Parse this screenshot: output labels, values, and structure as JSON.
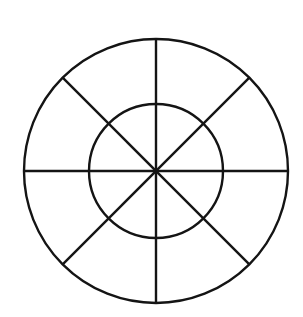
{
  "document": {
    "title": "Segmented Wheel Diagram",
    "background_color": "#ffffff",
    "width": 303,
    "height": 317
  },
  "chart_data": {
    "type": "pie",
    "title": "",
    "subtitle": "",
    "xlabel": "",
    "ylabel": "",
    "categories": [
      "S1",
      "S2",
      "S3",
      "S4",
      "S5",
      "S6",
      "S7",
      "S8"
    ],
    "values": [
      12.5,
      12.5,
      12.5,
      12.5,
      12.5,
      12.5,
      12.5,
      12.5
    ],
    "slice_angle_degrees": 45,
    "slice_count": 8,
    "legend": [],
    "labels_shown": false,
    "grid": false,
    "rings": [
      {
        "name": "outer-ring",
        "radius": 132
      },
      {
        "name": "inner-ring",
        "radius": 67
      }
    ]
  },
  "geometry": {
    "center": {
      "x": 156,
      "y": 171
    },
    "outer_circle": {
      "radius": 132,
      "left": 24,
      "right": 288,
      "top": 39,
      "bottom": 303
    },
    "inner_circle": {
      "radius": 67,
      "left": 89,
      "right": 223,
      "top": 104,
      "bottom": 238
    },
    "spokes": [
      {
        "name": "spoke-vertical",
        "angle_degrees": 90
      },
      {
        "name": "spoke-diagonal-ne-sw",
        "angle_degrees": 45
      },
      {
        "name": "spoke-horizontal",
        "angle_degrees": 0
      },
      {
        "name": "spoke-diagonal-nw-se",
        "angle_degrees": 135
      }
    ]
  },
  "style": {
    "stroke_color": "#141414",
    "stroke_width": 2.4,
    "fill": "none"
  }
}
